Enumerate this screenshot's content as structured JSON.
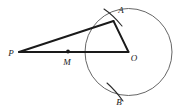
{
  "figure": {
    "background_color": "#ffffff",
    "stroke_color": "#1a1a1a",
    "circle_stroke_color": "#555555",
    "labels": {
      "point_p": "P",
      "point_a": "A",
      "point_o": "O",
      "point_m": "M",
      "point_b": "B"
    },
    "points": {
      "p": {
        "name": "P",
        "x": 19,
        "y": 52,
        "label_x": 11,
        "label_y": 55
      },
      "a": {
        "name": "A",
        "x": 113,
        "y": 21,
        "label_x": 119,
        "label_y": 12
      },
      "o": {
        "name": "O",
        "x": 128,
        "y": 52,
        "label_x": 133,
        "label_y": 60
      },
      "m": {
        "name": "M",
        "x": 68,
        "y": 52,
        "label_x": 65,
        "label_y": 64
      },
      "b": {
        "name": "B",
        "x": 115,
        "y": 94,
        "label_x": 117,
        "label_y": 104
      }
    },
    "circle": {
      "cx": 128.5,
      "cy": 52,
      "r": 43.5
    },
    "segments": [
      {
        "name": "segment-PA",
        "x1": 19,
        "y1": 52,
        "x2": 113,
        "y2": 21
      },
      {
        "name": "segment-AO",
        "x1": 113,
        "y1": 21,
        "x2": 128,
        "y2": 52
      },
      {
        "name": "segment-PO",
        "x1": 19,
        "y1": 52,
        "x2": 128,
        "y2": 52
      }
    ],
    "arc_marks": [
      {
        "name": "arc-mark-A",
        "x1": 104,
        "y1": 10,
        "x2": 122,
        "y2": 25
      },
      {
        "name": "arc-mark-B",
        "x1": 107,
        "y1": 84,
        "x2": 122,
        "y2": 100
      }
    ]
  }
}
